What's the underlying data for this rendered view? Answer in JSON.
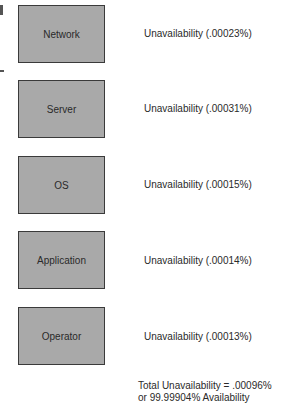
{
  "diagram": {
    "components": [
      {
        "name": "Network",
        "unavailability": "Unavailability (.00023%)"
      },
      {
        "name": "Server",
        "unavailability": "Unavailability (.00031%)"
      },
      {
        "name": "OS",
        "unavailability": "Unavailability (.00015%)"
      },
      {
        "name": "Application",
        "unavailability": "Unavailability (.00014%)"
      },
      {
        "name": "Operator",
        "unavailability": "Unavailability (.00013%)"
      }
    ],
    "total_line1": "Total Unavailability = .00096%",
    "total_line2": "or 99.99904% Availability"
  }
}
